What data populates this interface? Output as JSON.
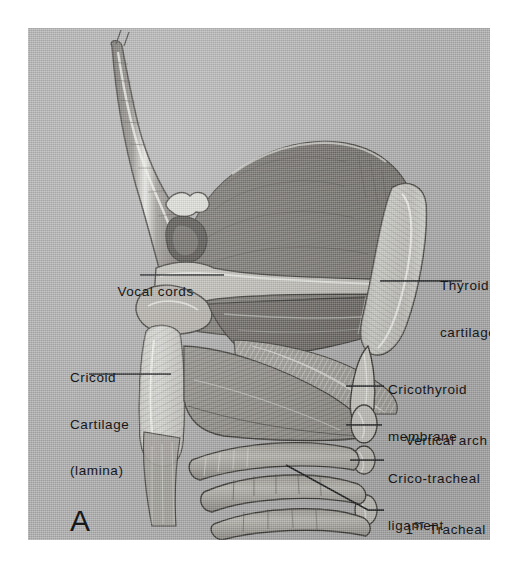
{
  "figure": {
    "panel_letter": "A",
    "background_color": "#b0b0b0",
    "ink_color": "#17181a"
  },
  "labels": {
    "vocal_cords": "Vocal cords",
    "thyroid_cartilage_line1": "Thyroid",
    "thyroid_cartilage_line2": "cartilage",
    "cricoid_line1": "Cricoid",
    "cricoid_line2": "Cartilage",
    "cricoid_line3": "(lamina)",
    "cricothyroid_line1": "Cricothyroid",
    "cricothyroid_line2": "membrane",
    "vertical_arch": "Vertical arch",
    "crico_tracheal_line1": "Crico-tracheal",
    "crico_tracheal_line2": "ligament",
    "tracheal_ring_number": "1",
    "tracheal_ring_suffix": "ST",
    "tracheal_ring_rest": " Tracheal ring"
  }
}
